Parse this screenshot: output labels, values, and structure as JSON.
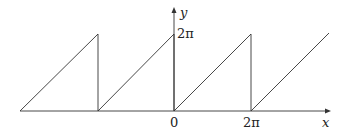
{
  "figure": {
    "type": "sawtooth-function-graph",
    "axes": {
      "x_label": "x",
      "y_label": "y"
    },
    "tick_labels": {
      "x_origin": "0",
      "x_period": "2π",
      "y_top": "2π"
    },
    "colors": {
      "line": "#333333",
      "background": "#ffffff"
    }
  }
}
